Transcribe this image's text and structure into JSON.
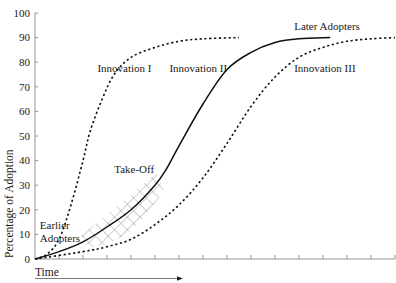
{
  "chart_data": {
    "type": "line",
    "title": "",
    "xlabel": "Time",
    "ylabel": "Percentage of Adoption",
    "ylim": [
      0,
      100
    ],
    "xlim": [
      0,
      15
    ],
    "yticks": [
      0,
      10,
      20,
      30,
      40,
      50,
      60,
      70,
      80,
      90,
      100
    ],
    "xticks_count": 15,
    "x_tick_labels_shown": false,
    "grid": false,
    "series": [
      {
        "name": "Innovation I",
        "style": "dashed",
        "x": [
          0,
          0.5,
          1,
          1.5,
          2,
          2.3,
          2.8,
          3.3,
          4,
          5,
          6,
          7,
          8.5
        ],
        "values": [
          0,
          2,
          8,
          22,
          40,
          52,
          65,
          75,
          82,
          86,
          88.5,
          89.5,
          90
        ]
      },
      {
        "name": "Innovation II",
        "style": "solid",
        "x": [
          0,
          1,
          2,
          3,
          4,
          5,
          5.5,
          6,
          7,
          8,
          9,
          10,
          11,
          12.3
        ],
        "values": [
          0,
          3,
          7,
          13,
          20,
          30,
          37,
          46,
          63,
          77,
          84,
          88,
          89.5,
          90
        ]
      },
      {
        "name": "Innovation III",
        "style": "dashed",
        "x": [
          0,
          2,
          3,
          4,
          5,
          6,
          7,
          8,
          9,
          10,
          11,
          12,
          13,
          14,
          15
        ],
        "values": [
          0,
          3,
          5,
          8,
          14,
          22,
          33,
          47,
          62,
          74,
          82,
          86,
          88.5,
          89.5,
          90
        ]
      }
    ],
    "annotations": [
      {
        "text": "Innovation I",
        "x": 2.6,
        "y": 76
      },
      {
        "text": "Innovation II",
        "x": 5.6,
        "y": 76
      },
      {
        "text": "Innovation III",
        "x": 10.8,
        "y": 76
      },
      {
        "text": "Later Adopters",
        "x": 10.8,
        "y": 93
      },
      {
        "text": "Take-Off",
        "x": 3.3,
        "y": 35
      },
      {
        "text": "Earlier",
        "x": 0.2,
        "y": 12
      },
      {
        "text": "Adopters",
        "x": 0.2,
        "y": 7
      }
    ],
    "highlight_region": {
      "label": "Take-Off",
      "pattern": "crosshatch",
      "x_range": [
        2.1,
        5.2
      ],
      "along_series": "Innovation II"
    }
  }
}
